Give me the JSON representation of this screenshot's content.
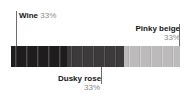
{
  "chart_data": {
    "type": "bar",
    "title": "",
    "orientation": "horizontal-stacked",
    "categories": [
      "Wine",
      "Dusky rose",
      "Pinky beige"
    ],
    "values": [
      33,
      33,
      33
    ],
    "value_unit": "%",
    "colors": [
      "#1f1c1d",
      "#3c3a3b",
      "#bdbabb"
    ],
    "legend_position": "callout-labels",
    "grid": false,
    "xlabel": "",
    "ylabel": ""
  },
  "palette_bar": {
    "name": "color-proportion-bar",
    "segments": [
      {
        "label": "Wine",
        "percent": "33%",
        "color": "#1f1c1d"
      },
      {
        "label": "Dusky rose",
        "percent": "33%",
        "color": "#3c3a3b"
      },
      {
        "label": "Pinky beige",
        "percent": "33%",
        "color": "#bdbabb"
      }
    ]
  },
  "callouts": {
    "wine": {
      "name": "Wine",
      "percent": "33%"
    },
    "pinky_beige": {
      "name": "Pinky beige",
      "percent": "33%"
    },
    "dusky_rose": {
      "name": "Dusky rose",
      "percent": "33%"
    }
  }
}
